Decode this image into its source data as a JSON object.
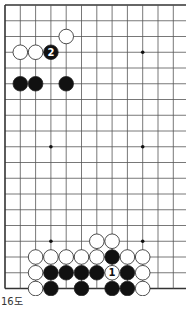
{
  "diagram": {
    "caption": "16도",
    "board": {
      "origin_x": 5,
      "origin_y": 5,
      "step_x": 15.3,
      "step_y": 15.75,
      "cols": 12,
      "rows": 19,
      "right_edge_open": true,
      "line_color": "#555555",
      "edge_color": "#333333"
    },
    "star_points": [
      {
        "col": 3,
        "row": 3
      },
      {
        "col": 9,
        "row": 3
      },
      {
        "col": 3,
        "row": 9
      },
      {
        "col": 9,
        "row": 9
      },
      {
        "col": 3,
        "row": 15
      },
      {
        "col": 9,
        "row": 15
      }
    ],
    "stones": [
      {
        "color": "white",
        "col": 4,
        "row": 2
      },
      {
        "color": "white",
        "col": 1,
        "row": 3
      },
      {
        "color": "white",
        "col": 2,
        "row": 3
      },
      {
        "color": "black",
        "col": 3,
        "row": 3,
        "label": "2"
      },
      {
        "color": "black",
        "col": 1,
        "row": 5
      },
      {
        "color": "black",
        "col": 2,
        "row": 5
      },
      {
        "color": "black",
        "col": 4,
        "row": 5
      },
      {
        "color": "white",
        "col": 6,
        "row": 15
      },
      {
        "color": "white",
        "col": 7,
        "row": 15
      },
      {
        "color": "white",
        "col": 2,
        "row": 16
      },
      {
        "color": "white",
        "col": 3,
        "row": 16
      },
      {
        "color": "white",
        "col": 4,
        "row": 16
      },
      {
        "color": "white",
        "col": 5,
        "row": 16
      },
      {
        "color": "white",
        "col": 6,
        "row": 16
      },
      {
        "color": "black",
        "col": 7,
        "row": 16
      },
      {
        "color": "white",
        "col": 8,
        "row": 16
      },
      {
        "color": "white",
        "col": 9,
        "row": 16
      },
      {
        "color": "white",
        "col": 2,
        "row": 17
      },
      {
        "color": "black",
        "col": 3,
        "row": 17
      },
      {
        "color": "black",
        "col": 4,
        "row": 17
      },
      {
        "color": "black",
        "col": 5,
        "row": 17
      },
      {
        "color": "black",
        "col": 6,
        "row": 17
      },
      {
        "color": "white",
        "col": 7,
        "row": 17,
        "label": "1"
      },
      {
        "color": "black",
        "col": 8,
        "row": 17
      },
      {
        "color": "white",
        "col": 9,
        "row": 17
      },
      {
        "color": "white",
        "col": 2,
        "row": 18
      },
      {
        "color": "black",
        "col": 3,
        "row": 18
      },
      {
        "color": "black",
        "col": 5,
        "row": 18
      },
      {
        "color": "black",
        "col": 7,
        "row": 18
      },
      {
        "color": "black",
        "col": 8,
        "row": 18
      },
      {
        "color": "white",
        "col": 9,
        "row": 18
      }
    ]
  }
}
